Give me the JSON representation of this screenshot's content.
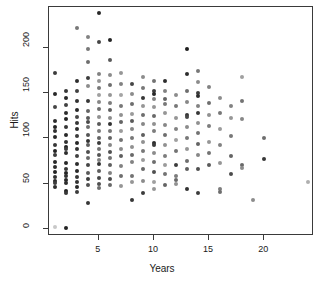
{
  "chart_data": {
    "type": "scatter",
    "title": "",
    "xlabel": "Years",
    "ylabel": "Hits",
    "xlim": [
      0.5,
      24.5
    ],
    "ylim": [
      -8,
      245
    ],
    "grid": false,
    "legend": null,
    "xticks": [
      5,
      10,
      15,
      20
    ],
    "yticks": [
      0,
      50,
      100,
      150,
      200
    ],
    "xtick_labels": [
      "5",
      "10",
      "15",
      "20"
    ],
    "ytick_labels": [
      "0",
      "50",
      "100",
      "150",
      "200"
    ],
    "marker": "filled-circle",
    "marker_size_px": 4,
    "note": "points shaded in varying gray levels; darker at low Years, lighter toward mid/high Years",
    "points": [
      {
        "x": 1,
        "y": 172,
        "g": 60
      },
      {
        "x": 1,
        "y": 149,
        "g": 40
      },
      {
        "x": 1,
        "y": 135,
        "g": 70
      },
      {
        "x": 1,
        "y": 119,
        "g": 45
      },
      {
        "x": 1,
        "y": 112,
        "g": 35
      },
      {
        "x": 1,
        "y": 108,
        "g": 50
      },
      {
        "x": 1,
        "y": 101,
        "g": 40
      },
      {
        "x": 1,
        "y": 92,
        "g": 55
      },
      {
        "x": 1,
        "y": 86,
        "g": 35
      },
      {
        "x": 1,
        "y": 81,
        "g": 60
      },
      {
        "x": 1,
        "y": 74,
        "g": 40
      },
      {
        "x": 1,
        "y": 68,
        "g": 45
      },
      {
        "x": 1,
        "y": 63,
        "g": 35
      },
      {
        "x": 1,
        "y": 57,
        "g": 50
      },
      {
        "x": 1,
        "y": 53,
        "g": 40
      },
      {
        "x": 1,
        "y": 51,
        "g": 60
      },
      {
        "x": 1,
        "y": 46,
        "g": 45
      },
      {
        "x": 1,
        "y": 2,
        "g": 200
      },
      {
        "x": 2,
        "y": 152,
        "g": 55
      },
      {
        "x": 2,
        "y": 145,
        "g": 40
      },
      {
        "x": 2,
        "y": 137,
        "g": 65
      },
      {
        "x": 2,
        "y": 128,
        "g": 45
      },
      {
        "x": 2,
        "y": 121,
        "g": 35
      },
      {
        "x": 2,
        "y": 112,
        "g": 55
      },
      {
        "x": 2,
        "y": 104,
        "g": 40
      },
      {
        "x": 2,
        "y": 96,
        "g": 50
      },
      {
        "x": 2,
        "y": 90,
        "g": 35
      },
      {
        "x": 2,
        "y": 88,
        "g": 60
      },
      {
        "x": 2,
        "y": 84,
        "g": 45
      },
      {
        "x": 2,
        "y": 73,
        "g": 40
      },
      {
        "x": 2,
        "y": 66,
        "g": 55
      },
      {
        "x": 2,
        "y": 62,
        "g": 35
      },
      {
        "x": 2,
        "y": 58,
        "g": 50
      },
      {
        "x": 2,
        "y": 54,
        "g": 40
      },
      {
        "x": 2,
        "y": 51,
        "g": 45
      },
      {
        "x": 2,
        "y": 42,
        "g": 35
      },
      {
        "x": 2,
        "y": 40,
        "g": 55
      },
      {
        "x": 2,
        "y": 1,
        "g": 35
      },
      {
        "x": 3,
        "y": 222,
        "g": 120
      },
      {
        "x": 3,
        "y": 163,
        "g": 45
      },
      {
        "x": 3,
        "y": 152,
        "g": 65
      },
      {
        "x": 3,
        "y": 141,
        "g": 50
      },
      {
        "x": 3,
        "y": 131,
        "g": 40
      },
      {
        "x": 3,
        "y": 124,
        "g": 70
      },
      {
        "x": 3,
        "y": 117,
        "g": 55
      },
      {
        "x": 3,
        "y": 110,
        "g": 45
      },
      {
        "x": 3,
        "y": 103,
        "g": 60
      },
      {
        "x": 3,
        "y": 95,
        "g": 40
      },
      {
        "x": 3,
        "y": 88,
        "g": 50
      },
      {
        "x": 3,
        "y": 80,
        "g": 65
      },
      {
        "x": 3,
        "y": 72,
        "g": 45
      },
      {
        "x": 3,
        "y": 64,
        "g": 40
      },
      {
        "x": 3,
        "y": 57,
        "g": 55
      },
      {
        "x": 3,
        "y": 52,
        "g": 50
      },
      {
        "x": 3,
        "y": 46,
        "g": 40
      },
      {
        "x": 3,
        "y": 41,
        "g": 60
      },
      {
        "x": 4,
        "y": 212,
        "g": 130
      },
      {
        "x": 4,
        "y": 199,
        "g": 120
      },
      {
        "x": 4,
        "y": 184,
        "g": 110
      },
      {
        "x": 4,
        "y": 167,
        "g": 60
      },
      {
        "x": 4,
        "y": 158,
        "g": 140
      },
      {
        "x": 4,
        "y": 141,
        "g": 55
      },
      {
        "x": 4,
        "y": 130,
        "g": 100
      },
      {
        "x": 4,
        "y": 122,
        "g": 90
      },
      {
        "x": 4,
        "y": 118,
        "g": 75
      },
      {
        "x": 4,
        "y": 112,
        "g": 110
      },
      {
        "x": 4,
        "y": 104,
        "g": 85
      },
      {
        "x": 4,
        "y": 97,
        "g": 50
      },
      {
        "x": 4,
        "y": 92,
        "g": 95
      },
      {
        "x": 4,
        "y": 85,
        "g": 80
      },
      {
        "x": 4,
        "y": 78,
        "g": 105
      },
      {
        "x": 4,
        "y": 70,
        "g": 70
      },
      {
        "x": 4,
        "y": 62,
        "g": 90
      },
      {
        "x": 4,
        "y": 55,
        "g": 60
      },
      {
        "x": 4,
        "y": 48,
        "g": 80
      },
      {
        "x": 4,
        "y": 28,
        "g": 55
      },
      {
        "x": 5,
        "y": 238,
        "g": 40
      },
      {
        "x": 5,
        "y": 206,
        "g": 70
      },
      {
        "x": 5,
        "y": 171,
        "g": 130
      },
      {
        "x": 5,
        "y": 163,
        "g": 150
      },
      {
        "x": 5,
        "y": 155,
        "g": 120
      },
      {
        "x": 5,
        "y": 148,
        "g": 160
      },
      {
        "x": 5,
        "y": 140,
        "g": 135
      },
      {
        "x": 5,
        "y": 132,
        "g": 110
      },
      {
        "x": 5,
        "y": 124,
        "g": 145
      },
      {
        "x": 5,
        "y": 116,
        "g": 90
      },
      {
        "x": 5,
        "y": 108,
        "g": 125
      },
      {
        "x": 5,
        "y": 100,
        "g": 100
      },
      {
        "x": 5,
        "y": 95,
        "g": 60
      },
      {
        "x": 5,
        "y": 88,
        "g": 115
      },
      {
        "x": 5,
        "y": 82,
        "g": 85
      },
      {
        "x": 5,
        "y": 76,
        "g": 130
      },
      {
        "x": 5,
        "y": 72,
        "g": 50
      },
      {
        "x": 5,
        "y": 64,
        "g": 95
      },
      {
        "x": 5,
        "y": 56,
        "g": 70
      },
      {
        "x": 5,
        "y": 49,
        "g": 80
      },
      {
        "x": 5,
        "y": 45,
        "g": 110
      },
      {
        "x": 6,
        "y": 209,
        "g": 35
      },
      {
        "x": 6,
        "y": 187,
        "g": 90
      },
      {
        "x": 6,
        "y": 170,
        "g": 140
      },
      {
        "x": 6,
        "y": 159,
        "g": 110
      },
      {
        "x": 6,
        "y": 148,
        "g": 150
      },
      {
        "x": 6,
        "y": 139,
        "g": 125
      },
      {
        "x": 6,
        "y": 131,
        "g": 95
      },
      {
        "x": 6,
        "y": 122,
        "g": 140
      },
      {
        "x": 6,
        "y": 116,
        "g": 50
      },
      {
        "x": 6,
        "y": 108,
        "g": 120
      },
      {
        "x": 6,
        "y": 100,
        "g": 100
      },
      {
        "x": 6,
        "y": 92,
        "g": 135
      },
      {
        "x": 6,
        "y": 85,
        "g": 80
      },
      {
        "x": 6,
        "y": 78,
        "g": 115
      },
      {
        "x": 6,
        "y": 70,
        "g": 95
      },
      {
        "x": 6,
        "y": 62,
        "g": 130
      },
      {
        "x": 6,
        "y": 55,
        "g": 75
      },
      {
        "x": 6,
        "y": 48,
        "g": 105
      },
      {
        "x": 7,
        "y": 172,
        "g": 150
      },
      {
        "x": 7,
        "y": 160,
        "g": 130
      },
      {
        "x": 7,
        "y": 148,
        "g": 165
      },
      {
        "x": 7,
        "y": 136,
        "g": 120
      },
      {
        "x": 7,
        "y": 126,
        "g": 145
      },
      {
        "x": 7,
        "y": 118,
        "g": 100
      },
      {
        "x": 7,
        "y": 108,
        "g": 155
      },
      {
        "x": 7,
        "y": 98,
        "g": 115
      },
      {
        "x": 7,
        "y": 88,
        "g": 140
      },
      {
        "x": 7,
        "y": 80,
        "g": 95
      },
      {
        "x": 7,
        "y": 69,
        "g": 130
      },
      {
        "x": 7,
        "y": 58,
        "g": 110
      },
      {
        "x": 7,
        "y": 47,
        "g": 150
      },
      {
        "x": 8,
        "y": 160,
        "g": 70
      },
      {
        "x": 8,
        "y": 149,
        "g": 140
      },
      {
        "x": 8,
        "y": 138,
        "g": 110
      },
      {
        "x": 8,
        "y": 127,
        "g": 155
      },
      {
        "x": 8,
        "y": 119,
        "g": 90
      },
      {
        "x": 8,
        "y": 110,
        "g": 135
      },
      {
        "x": 8,
        "y": 100,
        "g": 120
      },
      {
        "x": 8,
        "y": 90,
        "g": 145
      },
      {
        "x": 8,
        "y": 82,
        "g": 105
      },
      {
        "x": 8,
        "y": 74,
        "g": 130
      },
      {
        "x": 8,
        "y": 58,
        "g": 115
      },
      {
        "x": 8,
        "y": 52,
        "g": 150
      },
      {
        "x": 8,
        "y": 32,
        "g": 55
      },
      {
        "x": 9,
        "y": 168,
        "g": 140
      },
      {
        "x": 9,
        "y": 155,
        "g": 120
      },
      {
        "x": 9,
        "y": 144,
        "g": 55
      },
      {
        "x": 9,
        "y": 136,
        "g": 150
      },
      {
        "x": 9,
        "y": 126,
        "g": 110
      },
      {
        "x": 9,
        "y": 116,
        "g": 135
      },
      {
        "x": 9,
        "y": 104,
        "g": 95
      },
      {
        "x": 9,
        "y": 96,
        "g": 145
      },
      {
        "x": 9,
        "y": 86,
        "g": 120
      },
      {
        "x": 9,
        "y": 76,
        "g": 155
      },
      {
        "x": 9,
        "y": 66,
        "g": 105
      },
      {
        "x": 9,
        "y": 53,
        "g": 140
      },
      {
        "x": 9,
        "y": 40,
        "g": 60
      },
      {
        "x": 10,
        "y": 163,
        "g": 115
      },
      {
        "x": 10,
        "y": 152,
        "g": 60
      },
      {
        "x": 10,
        "y": 149,
        "g": 40
      },
      {
        "x": 10,
        "y": 143,
        "g": 130
      },
      {
        "x": 10,
        "y": 134,
        "g": 150
      },
      {
        "x": 10,
        "y": 125,
        "g": 105
      },
      {
        "x": 10,
        "y": 116,
        "g": 145
      },
      {
        "x": 10,
        "y": 108,
        "g": 125
      },
      {
        "x": 10,
        "y": 95,
        "g": 45
      },
      {
        "x": 10,
        "y": 93,
        "g": 60
      },
      {
        "x": 10,
        "y": 84,
        "g": 140
      },
      {
        "x": 10,
        "y": 74,
        "g": 110
      },
      {
        "x": 10,
        "y": 63,
        "g": 80
      },
      {
        "x": 10,
        "y": 52,
        "g": 160
      },
      {
        "x": 10,
        "y": 44,
        "g": 150
      },
      {
        "x": 11,
        "y": 163,
        "g": 45
      },
      {
        "x": 11,
        "y": 152,
        "g": 130
      },
      {
        "x": 11,
        "y": 143,
        "g": 100
      },
      {
        "x": 11,
        "y": 138,
        "g": 120
      },
      {
        "x": 11,
        "y": 128,
        "g": 150
      },
      {
        "x": 11,
        "y": 115,
        "g": 135
      },
      {
        "x": 11,
        "y": 104,
        "g": 110
      },
      {
        "x": 11,
        "y": 92,
        "g": 145
      },
      {
        "x": 11,
        "y": 80,
        "g": 125
      },
      {
        "x": 11,
        "y": 70,
        "g": 155
      },
      {
        "x": 11,
        "y": 60,
        "g": 115
      },
      {
        "x": 11,
        "y": 48,
        "g": 100
      },
      {
        "x": 12,
        "y": 148,
        "g": 140
      },
      {
        "x": 12,
        "y": 136,
        "g": 120
      },
      {
        "x": 12,
        "y": 122,
        "g": 150
      },
      {
        "x": 12,
        "y": 110,
        "g": 130
      },
      {
        "x": 12,
        "y": 98,
        "g": 160
      },
      {
        "x": 12,
        "y": 86,
        "g": 115
      },
      {
        "x": 12,
        "y": 70,
        "g": 60
      },
      {
        "x": 12,
        "y": 58,
        "g": 125
      },
      {
        "x": 12,
        "y": 54,
        "g": 105
      },
      {
        "x": 12,
        "y": 50,
        "g": 145
      },
      {
        "x": 13,
        "y": 199,
        "g": 30
      },
      {
        "x": 13,
        "y": 171,
        "g": 45
      },
      {
        "x": 13,
        "y": 152,
        "g": 110
      },
      {
        "x": 13,
        "y": 140,
        "g": 135
      },
      {
        "x": 13,
        "y": 126,
        "g": 55
      },
      {
        "x": 13,
        "y": 124,
        "g": 70
      },
      {
        "x": 13,
        "y": 112,
        "g": 140
      },
      {
        "x": 13,
        "y": 100,
        "g": 120
      },
      {
        "x": 13,
        "y": 88,
        "g": 150
      },
      {
        "x": 13,
        "y": 75,
        "g": 110
      },
      {
        "x": 13,
        "y": 66,
        "g": 95
      },
      {
        "x": 13,
        "y": 44,
        "g": 50
      },
      {
        "x": 14,
        "y": 174,
        "g": 120
      },
      {
        "x": 14,
        "y": 162,
        "g": 140
      },
      {
        "x": 14,
        "y": 150,
        "g": 60
      },
      {
        "x": 14,
        "y": 147,
        "g": 45
      },
      {
        "x": 14,
        "y": 136,
        "g": 130
      },
      {
        "x": 14,
        "y": 128,
        "g": 55
      },
      {
        "x": 14,
        "y": 117,
        "g": 145
      },
      {
        "x": 14,
        "y": 106,
        "g": 115
      },
      {
        "x": 14,
        "y": 94,
        "g": 100
      },
      {
        "x": 14,
        "y": 82,
        "g": 135
      },
      {
        "x": 14,
        "y": 66,
        "g": 80
      },
      {
        "x": 14,
        "y": 39,
        "g": 60
      },
      {
        "x": 15,
        "y": 157,
        "g": 130
      },
      {
        "x": 15,
        "y": 139,
        "g": 110
      },
      {
        "x": 15,
        "y": 126,
        "g": 145
      },
      {
        "x": 15,
        "y": 113,
        "g": 125
      },
      {
        "x": 15,
        "y": 96,
        "g": 150
      },
      {
        "x": 15,
        "y": 84,
        "g": 115
      },
      {
        "x": 15,
        "y": 70,
        "g": 90
      },
      {
        "x": 16,
        "y": 144,
        "g": 140
      },
      {
        "x": 16,
        "y": 128,
        "g": 120
      },
      {
        "x": 16,
        "y": 110,
        "g": 155
      },
      {
        "x": 16,
        "y": 92,
        "g": 130
      },
      {
        "x": 16,
        "y": 73,
        "g": 150
      },
      {
        "x": 16,
        "y": 44,
        "g": 125
      },
      {
        "x": 16,
        "y": 41,
        "g": 110
      },
      {
        "x": 17,
        "y": 136,
        "g": 130
      },
      {
        "x": 17,
        "y": 122,
        "g": 150
      },
      {
        "x": 17,
        "y": 103,
        "g": 120
      },
      {
        "x": 17,
        "y": 80,
        "g": 100
      },
      {
        "x": 17,
        "y": 61,
        "g": 75
      },
      {
        "x": 18,
        "y": 168,
        "g": 160
      },
      {
        "x": 18,
        "y": 141,
        "g": 115
      },
      {
        "x": 18,
        "y": 121,
        "g": 135
      },
      {
        "x": 18,
        "y": 70,
        "g": 105
      },
      {
        "x": 18,
        "y": 67,
        "g": 140
      },
      {
        "x": 19,
        "y": 32,
        "g": 140
      },
      {
        "x": 20,
        "y": 100,
        "g": 110
      },
      {
        "x": 20,
        "y": 77,
        "g": 55
      },
      {
        "x": 24,
        "y": 52,
        "g": 175
      }
    ]
  },
  "axes": {
    "x_title": "Years",
    "y_title": "Hits"
  }
}
